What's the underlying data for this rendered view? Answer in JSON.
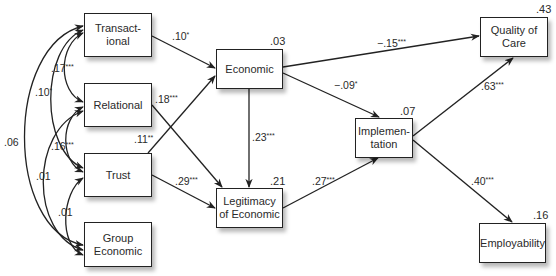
{
  "nodes": {
    "transactional": {
      "label": "Transact-\nional",
      "line1": "Transact-",
      "line2": "ional"
    },
    "relational": {
      "label": "Relational"
    },
    "trust": {
      "label": "Trust"
    },
    "group_economic": {
      "label": "Group Economic",
      "line1": "Group",
      "line2": "Economic"
    },
    "economic": {
      "label": "Economic",
      "r2": ".03"
    },
    "legitimacy": {
      "label": "Legitimacy of Economic",
      "line1": "Legitimacy",
      "line2": "of Economic",
      "r2": ".21"
    },
    "implementation": {
      "label": "Implemen-\ntation",
      "line1": "Implemen-",
      "line2": "tation",
      "r2": ".07"
    },
    "quality_of_care": {
      "label": "Quality of Care",
      "line1": "Quality of",
      "line2": "Care",
      "r2": ".43"
    },
    "employability": {
      "label": "Employability",
      "r2": ".16"
    }
  },
  "paths": [
    {
      "from": "transactional",
      "to": "economic",
      "coef": ".10",
      "sig": "*"
    },
    {
      "from": "relational",
      "to": "legitimacy",
      "coef": ".18",
      "sig": "***"
    },
    {
      "from": "trust",
      "to": "economic",
      "coef": ".11",
      "sig": "**"
    },
    {
      "from": "trust",
      "to": "legitimacy",
      "coef": ".29",
      "sig": "***"
    },
    {
      "from": "economic",
      "to": "legitimacy",
      "coef": ".23",
      "sig": "***"
    },
    {
      "from": "economic",
      "to": "quality_of_care",
      "coef": "−.15",
      "sig": "***"
    },
    {
      "from": "economic",
      "to": "implementation",
      "coef": "−.09",
      "sig": "*"
    },
    {
      "from": "legitimacy",
      "to": "implementation",
      "coef": ".27",
      "sig": "***"
    },
    {
      "from": "implementation",
      "to": "quality_of_care",
      "coef": ".63",
      "sig": "***"
    },
    {
      "from": "implementation",
      "to": "employability",
      "coef": ".40",
      "sig": "***"
    }
  ],
  "correlations": [
    {
      "between": [
        "transactional",
        "relational"
      ],
      "coef": ".17",
      "sig": "***"
    },
    {
      "between": [
        "transactional",
        "trust"
      ],
      "coef": ".10",
      "sig": "*"
    },
    {
      "between": [
        "transactional",
        "group_economic"
      ],
      "coef": ".06",
      "sig": ""
    },
    {
      "between": [
        "relational",
        "trust"
      ],
      "coef": ".16",
      "sig": "***"
    },
    {
      "between": [
        "relational",
        "group_economic"
      ],
      "coef": ".01",
      "sig": ""
    },
    {
      "between": [
        "trust",
        "group_economic"
      ],
      "coef": ".01",
      "sig": ""
    }
  ]
}
